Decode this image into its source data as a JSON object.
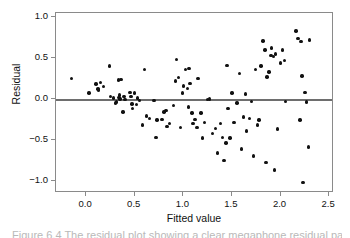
{
  "figure": {
    "caption": "Figure 6.4  The residual plot showing a clear megaphone residual pattern"
  },
  "chart_data": {
    "type": "scatter",
    "title": "",
    "xlabel": "Fitted value",
    "ylabel": "Residual",
    "xlim": [
      -0.31,
      2.55
    ],
    "ylim": [
      -1.15,
      1.05
    ],
    "xticks": [
      0.0,
      0.5,
      1.0,
      1.5,
      2.0,
      2.5
    ],
    "xtick_labels": [
      "0.0",
      "0.5",
      "1.0",
      "1.5",
      "2.0",
      "2.5"
    ],
    "yticks": [
      1.0,
      0.5,
      0.0,
      -0.5,
      -1.0
    ],
    "ytick_labels": [
      "1.0",
      "0.5",
      "0.0",
      "-0.5",
      "-1.0"
    ],
    "grid": false,
    "legend": null,
    "reference_lines": [
      {
        "orientation": "horizontal",
        "y": 0.0,
        "color": "#6e6e6e"
      }
    ],
    "marker": {
      "shape": "circle",
      "color": "#111111",
      "size": 3.4
    },
    "series": [
      {
        "name": "residuals",
        "x": [
          -0.15,
          0.03,
          0.1,
          0.12,
          0.13,
          0.15,
          0.18,
          0.24,
          0.25,
          0.28,
          0.3,
          0.31,
          0.33,
          0.34,
          0.345,
          0.35,
          0.36,
          0.38,
          0.39,
          0.4,
          0.45,
          0.46,
          0.47,
          0.48,
          0.5,
          0.52,
          0.53,
          0.55,
          0.58,
          0.6,
          0.62,
          0.65,
          0.7,
          0.72,
          0.73,
          0.78,
          0.8,
          0.82,
          0.83,
          0.86,
          0.9,
          0.92,
          0.93,
          0.95,
          0.97,
          0.99,
          1.0,
          1.02,
          1.04,
          1.05,
          1.06,
          1.07,
          1.09,
          1.1,
          1.12,
          1.14,
          1.15,
          1.18,
          1.2,
          1.22,
          1.25,
          1.27,
          1.3,
          1.33,
          1.35,
          1.38,
          1.4,
          1.42,
          1.44,
          1.45,
          1.46,
          1.48,
          1.5,
          1.52,
          1.55,
          1.58,
          1.6,
          1.62,
          1.64,
          1.65,
          1.68,
          1.7,
          1.72,
          1.74,
          1.76,
          1.78,
          1.8,
          1.82,
          1.84,
          1.85,
          1.86,
          1.88,
          1.9,
          1.91,
          1.93,
          1.94,
          1.95,
          1.97,
          2.0,
          2.02,
          2.04,
          2.05,
          2.16,
          2.18,
          2.2,
          2.21,
          2.22,
          2.23,
          2.25,
          2.27,
          2.29,
          2.3
        ],
        "y": [
          0.25,
          0.07,
          0.18,
          0.12,
          0.11,
          0.2,
          0.15,
          0.4,
          0.03,
          0.01,
          -0.05,
          -0.04,
          0.23,
          0.02,
          0.05,
          0.0,
          0.24,
          -0.16,
          0.03,
          -0.01,
          0.08,
          0.03,
          -0.06,
          -0.12,
          0.07,
          -0.07,
          0.01,
          -0.02,
          -0.32,
          0.36,
          -0.21,
          -0.24,
          -0.02,
          -0.47,
          -0.26,
          -0.25,
          -0.16,
          -0.14,
          -0.34,
          -0.3,
          -0.08,
          0.22,
          0.48,
          0.26,
          -0.35,
          0.07,
          0.16,
          0.36,
          0.13,
          -0.1,
          0.37,
          0.19,
          -0.17,
          -0.3,
          -0.25,
          -0.35,
          0.25,
          -0.17,
          -0.48,
          -0.29,
          -0.01,
          0.0,
          -0.42,
          -0.36,
          -0.66,
          -0.3,
          -0.47,
          -0.75,
          -0.54,
          0.41,
          -0.12,
          -0.48,
          0.07,
          -0.29,
          -0.05,
          0.31,
          -0.61,
          -0.22,
          0.06,
          -0.39,
          -0.24,
          -0.03,
          -0.7,
          0.36,
          -0.32,
          -0.26,
          0.4,
          0.71,
          0.6,
          -0.78,
          0.27,
          0.33,
          0.53,
          0.62,
          0.52,
          -0.87,
          0.55,
          -0.37,
          0.44,
          0.6,
          0.47,
          -0.03,
          0.83,
          0.74,
          -0.26,
          0.7,
          0.28,
          -1.02,
          0.08,
          -0.04,
          -0.59,
          0.72
        ]
      }
    ]
  }
}
